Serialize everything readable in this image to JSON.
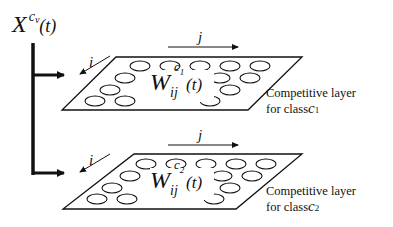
{
  "input": {
    "symbol": "X",
    "superscript": "c",
    "superscript_sub": "v",
    "argument": "(t)"
  },
  "layers": [
    {
      "weight_symbol": "W",
      "weight_sub": "ij",
      "weight_sup": "c",
      "weight_sup_sub": "1",
      "weight_arg": "(t)",
      "i_label": "i",
      "j_label": "j",
      "caption_line1": "Competitive layer",
      "caption_line2_prefix": "for class",
      "caption_class": "c",
      "caption_class_sub": "1"
    },
    {
      "weight_symbol": "W",
      "weight_sub": "ij",
      "weight_sup": "c",
      "weight_sup_sub": "2",
      "weight_arg": "(t)",
      "i_label": "i",
      "j_label": "j",
      "caption_line1": "Competitive layer",
      "caption_line2_prefix": "for class",
      "caption_class": "c",
      "caption_class_sub": "2"
    }
  ]
}
